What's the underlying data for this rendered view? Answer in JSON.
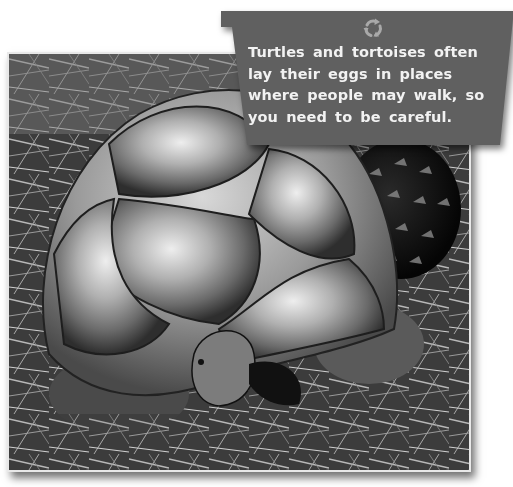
{
  "callout": {
    "icon": "recycle-icon",
    "text": "Turtles and tortoises often lay their eggs in places where people may walk, so you need to be careful.",
    "background_color": "#606060",
    "text_color": "#f2f2f2"
  },
  "photo": {
    "subject": "tortoise in pine needles beside a pine cone",
    "style": "black-and-white"
  }
}
